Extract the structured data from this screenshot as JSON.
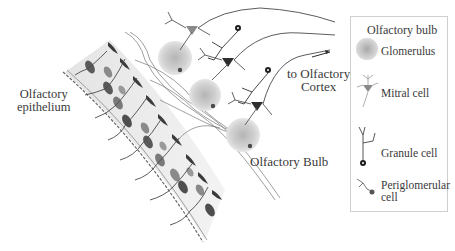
{
  "diagram": {
    "labels": {
      "epithelium": [
        "Olfactory",
        "epithelium"
      ],
      "cortex": [
        "to Olfactory",
        "Cortex"
      ],
      "bulb": "Olfactory Bulb"
    },
    "legend": {
      "title": "Olfactory bulb",
      "items": [
        {
          "name": "glomerulus",
          "label": "Glomerulus"
        },
        {
          "name": "mitral-cell",
          "label": "Mitral cell"
        },
        {
          "name": "granule-cell",
          "label": "Granule cell"
        },
        {
          "name": "periglomerular-cell",
          "label": [
            "Periglomerular",
            "cell"
          ]
        }
      ]
    },
    "colors": {
      "epithelium_fill": "#ececec",
      "receptor_dark": "#5a5a5a",
      "receptor_light": "#9a9a9a",
      "glomerulus": "#c8c8c8",
      "mitral_dark": "#2e2e2e",
      "mitral_light": "#8a8a8a",
      "line": "#555555"
    }
  }
}
